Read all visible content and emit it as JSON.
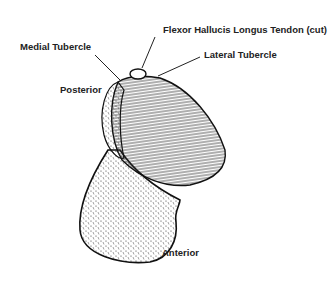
{
  "figure": {
    "labels": {
      "flexor_tendon": "Flexor Hallucis Longus Tendon (cut)",
      "medial_tubercle": "Medial Tubercle",
      "lateral_tubercle": "Lateral Tubercle",
      "posterior": "Posterior",
      "anterior": "Anterior"
    },
    "colors": {
      "ink": "#222222",
      "background": "#ffffff"
    }
  }
}
